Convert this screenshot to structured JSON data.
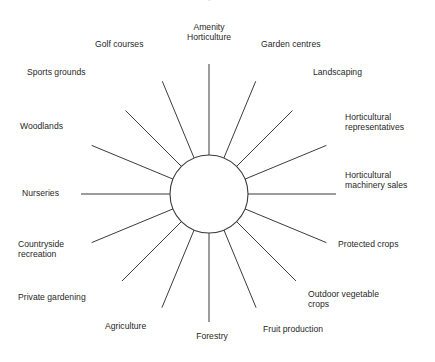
{
  "figure": {
    "title": "Amenity horticulture",
    "hub": {
      "label": "",
      "center_x": 209,
      "center_y": 194,
      "radius": 39
    },
    "style": {
      "line_color": "#3b3b3b",
      "text_color": "#1f1f1f",
      "background": "#ffffff"
    }
  },
  "chart_data": {
    "type": "diagram",
    "subtype": "radial-spoke",
    "title": "Amenity horticulture",
    "center_label": "",
    "spoke_count": 16,
    "angle_step_degrees": 22.5,
    "categories": [
      "Amenity\nHorticulture",
      "Garden centres",
      "Landscaping",
      "Horticultural\nrepresentatives",
      "Horticultural\nmachinery sales",
      "Protected crops",
      "Outdoor vegetable\ncrops",
      "Fruit production",
      "Forestry",
      "Agriculture",
      "Private gardening",
      "Countryside\nrecreation",
      "Nurseries",
      "Woodlands",
      "Sports grounds",
      "Golf courses"
    ],
    "values": [
      1,
      1,
      1,
      1,
      1,
      1,
      1,
      1,
      1,
      1,
      1,
      1,
      1,
      1,
      1,
      1
    ],
    "legend": [],
    "grid": false
  },
  "nodes": [
    {
      "id": "amenity-horticulture",
      "label": "Amenity\nHorticulture",
      "angle_deg": 0,
      "label_x": 185,
      "label_y": 22,
      "align": "center",
      "spoke_outer_r": 130
    },
    {
      "id": "garden-centres",
      "label": "Garden centres",
      "angle_deg": 22.5,
      "label_x": 261,
      "label_y": 39,
      "align": "left",
      "spoke_outer_r": 122
    },
    {
      "id": "landscaping",
      "label": "Landscaping",
      "angle_deg": 45,
      "label_x": 313,
      "label_y": 67,
      "align": "left",
      "spoke_outer_r": 118
    },
    {
      "id": "horticultural-representatives",
      "label": "Horticultural\nrepresentatives",
      "angle_deg": 67.5,
      "label_x": 345,
      "label_y": 112,
      "align": "left",
      "spoke_outer_r": 127
    },
    {
      "id": "horticultural-machinery-sales",
      "label": "Horticultural\nmachinery sales",
      "angle_deg": 90,
      "label_x": 345,
      "label_y": 170,
      "align": "left",
      "spoke_outer_r": 127
    },
    {
      "id": "protected-crops",
      "label": "Protected crops",
      "angle_deg": 112.5,
      "label_x": 338,
      "label_y": 239,
      "align": "left",
      "spoke_outer_r": 127
    },
    {
      "id": "outdoor-vegetable-crops",
      "label": "Outdoor vegetable\ncrops",
      "angle_deg": 135,
      "label_x": 308,
      "label_y": 289,
      "align": "left",
      "spoke_outer_r": 123
    },
    {
      "id": "fruit-production",
      "label": "Fruit production",
      "angle_deg": 157.5,
      "label_x": 263,
      "label_y": 324,
      "align": "left",
      "spoke_outer_r": 123
    },
    {
      "id": "forestry",
      "label": "Forestry",
      "angle_deg": 180,
      "label_x": 188,
      "label_y": 331,
      "align": "center",
      "spoke_outer_r": 128
    },
    {
      "id": "agriculture",
      "label": "Agriculture",
      "angle_deg": 202.5,
      "label_x": 105,
      "label_y": 321,
      "align": "left",
      "spoke_outer_r": 123
    },
    {
      "id": "private-gardening",
      "label": "Private gardening",
      "angle_deg": 225,
      "label_x": 18,
      "label_y": 292,
      "align": "left",
      "spoke_outer_r": 123
    },
    {
      "id": "countryside-recreation",
      "label": "Countryside\nrecreation",
      "angle_deg": 247.5,
      "label_x": 18,
      "label_y": 239,
      "align": "left",
      "spoke_outer_r": 127
    },
    {
      "id": "nurseries",
      "label": "Nurseries",
      "angle_deg": 270,
      "label_x": 22,
      "label_y": 188,
      "align": "left",
      "spoke_outer_r": 128
    },
    {
      "id": "woodlands",
      "label": "Woodlands",
      "angle_deg": 292.5,
      "label_x": 20,
      "label_y": 121,
      "align": "left",
      "spoke_outer_r": 127
    },
    {
      "id": "sports-grounds",
      "label": "Sports grounds",
      "angle_deg": 315,
      "label_x": 27,
      "label_y": 67,
      "align": "left",
      "spoke_outer_r": 118
    },
    {
      "id": "golf-courses",
      "label": "Golf courses",
      "angle_deg": 337.5,
      "label_x": 95,
      "label_y": 39,
      "align": "left",
      "spoke_outer_r": 122
    }
  ]
}
